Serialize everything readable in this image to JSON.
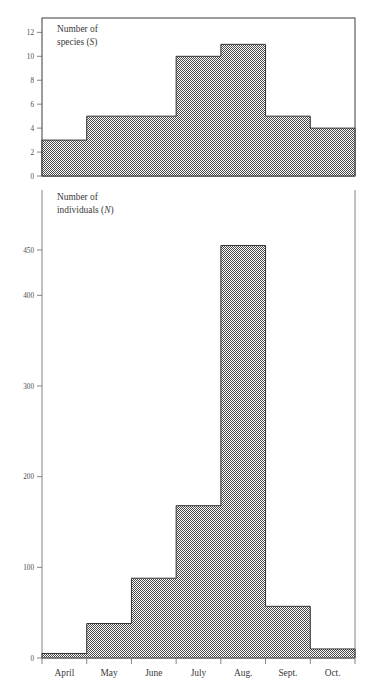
{
  "figure": {
    "background": "#ffffff",
    "fill_color": "#8c8c8c",
    "line_color": "#333333",
    "axis_color": "#777777"
  },
  "panels": {
    "top": {
      "label_line1": "Number of",
      "label_line2_prefix": "species (",
      "label_line2_italic": "S",
      "label_line2_suffix": ")",
      "yticks": [
        0,
        2,
        4,
        6,
        8,
        10,
        12
      ],
      "ytick_labels": [
        "0",
        "2",
        "4",
        "6",
        "8",
        "10",
        "12"
      ],
      "ymin": 0,
      "ymax": 13.2
    },
    "bottom": {
      "label_line1": "Number of",
      "label_line2_prefix": "individuals (",
      "label_line2_italic": "N",
      "label_line2_suffix": ")",
      "yticks": [
        0,
        100,
        200,
        300,
        400,
        450
      ],
      "ytick_labels": [
        "0",
        "100",
        "200",
        "300",
        "400",
        "450"
      ],
      "ymin": 0,
      "ymax": 470
    }
  },
  "xaxis": {
    "categories": [
      "April",
      "May",
      "June",
      "July",
      "Aug.",
      "Sept.",
      "Oct."
    ]
  },
  "chart_data": [
    {
      "type": "bar",
      "title": "Number of species (S)",
      "xlabel": "",
      "ylabel": "Number of species (S)",
      "categories": [
        "April",
        "May",
        "June",
        "July",
        "Aug.",
        "Sept.",
        "Oct."
      ],
      "values": [
        3,
        5,
        5,
        10,
        11,
        5,
        4
      ],
      "ylim": [
        0,
        13.2
      ],
      "yticks": [
        0,
        2,
        4,
        6,
        8,
        10,
        12
      ],
      "grid": false,
      "legend": "none",
      "style": "step-histogram"
    },
    {
      "type": "bar",
      "title": "Number of individuals (N)",
      "xlabel": "",
      "ylabel": "Number of individuals (N)",
      "categories": [
        "April",
        "May",
        "June",
        "July",
        "Aug.",
        "Sept.",
        "Oct."
      ],
      "values": [
        5,
        38,
        88,
        168,
        455,
        57,
        10
      ],
      "ylim": [
        0,
        470
      ],
      "yticks": [
        0,
        100,
        200,
        300,
        400,
        450
      ],
      "grid": false,
      "legend": "none",
      "style": "step-histogram"
    }
  ]
}
